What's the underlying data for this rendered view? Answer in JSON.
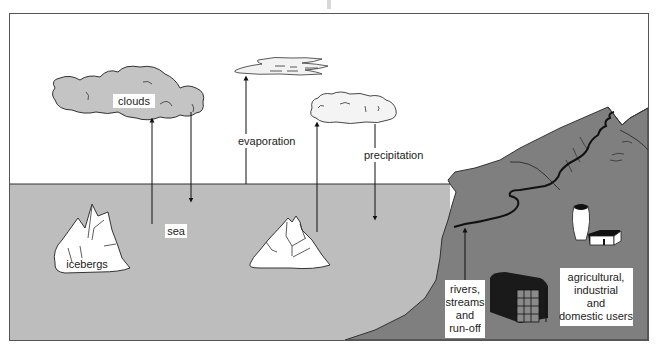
{
  "diagram": {
    "labels": {
      "clouds": "clouds",
      "evaporation": "evaporation",
      "precipitation": "precipitation",
      "sea": "sea",
      "icebergs": "icebergs",
      "rivers": [
        "rivers,",
        "streams",
        "and",
        "run-off"
      ],
      "users": [
        "agricultural,",
        "industrial",
        "and",
        "domestic users"
      ]
    },
    "colors": {
      "sky": "#ffffff",
      "sea": "#bdbdbd",
      "land": "#7f7f7f",
      "cloud_dark": "#c4c4c4",
      "cloud_light": "#f4f4f4",
      "ice": "#ffffff",
      "outline": "#333333"
    }
  }
}
